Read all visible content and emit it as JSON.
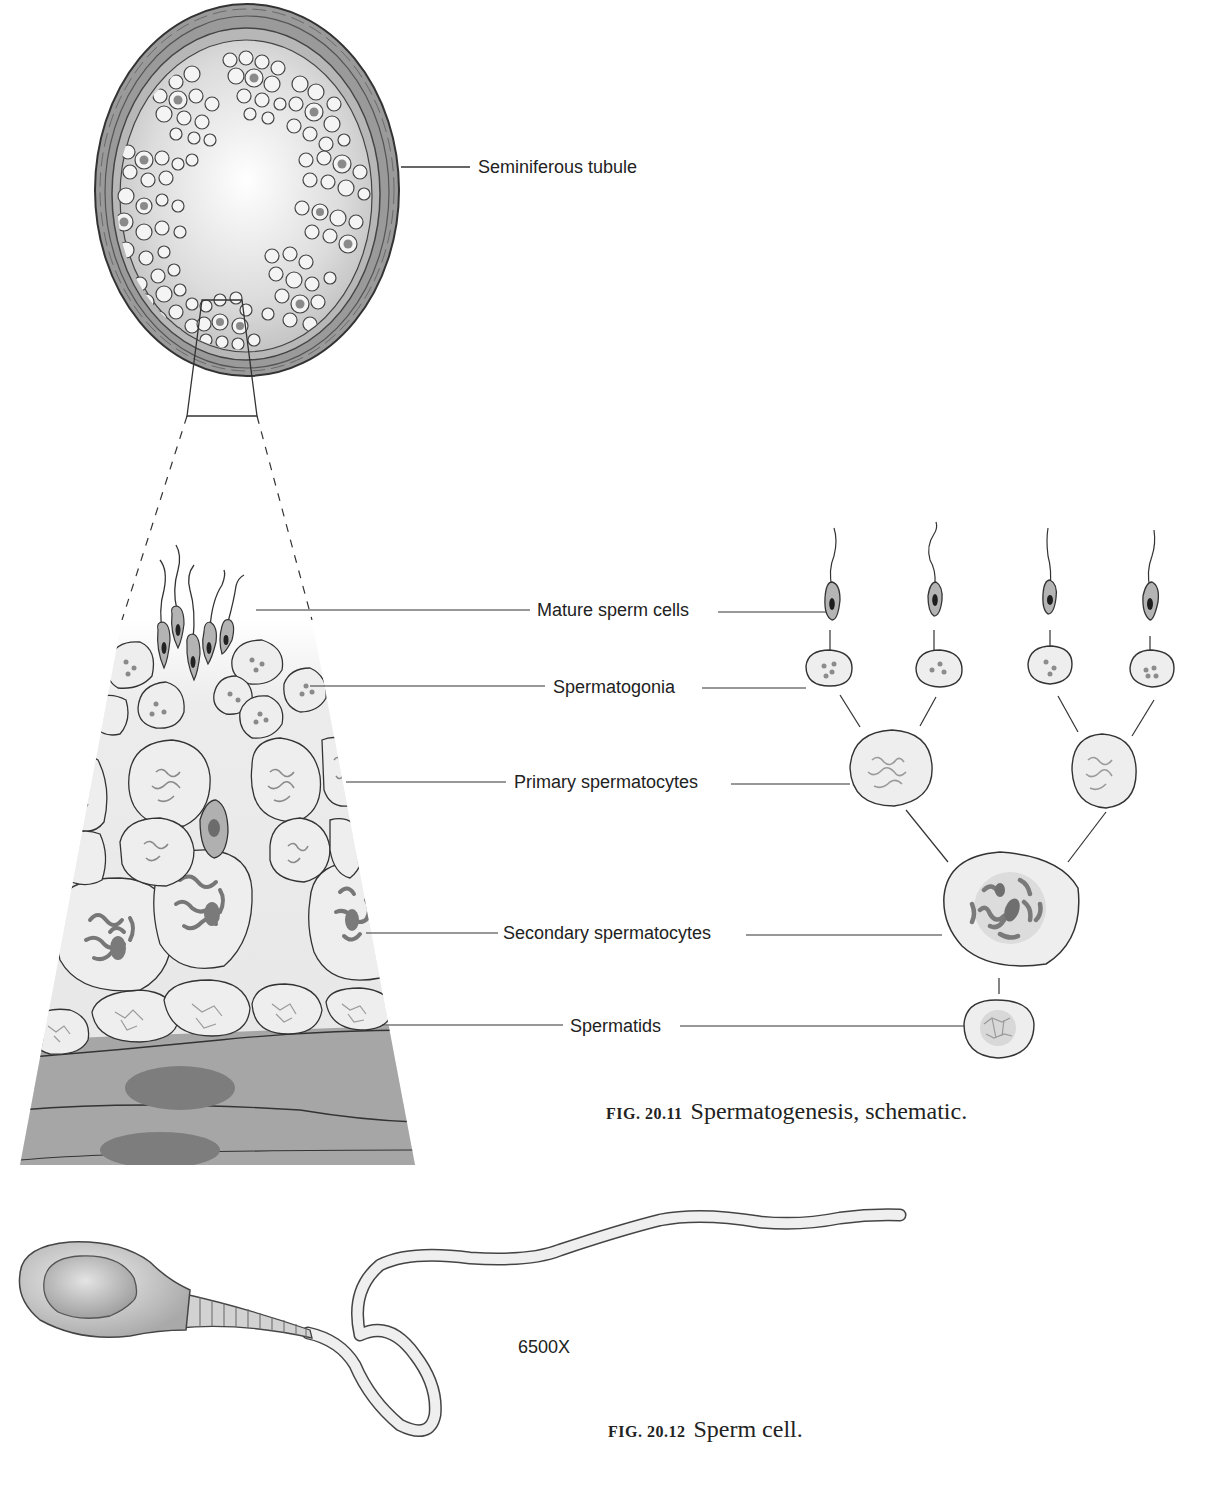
{
  "figure_20_11": {
    "caption_number": "FIG. 20.11",
    "caption_text": "Spermatogenesis, schematic.",
    "tubule_label": "Seminiferous tubule",
    "labels": [
      {
        "id": "mature-sperm-cells",
        "text": "Mature sperm cells"
      },
      {
        "id": "spermatogonia",
        "text": "Spermatogonia"
      },
      {
        "id": "primary-spermatocytes",
        "text": "Primary spermatocytes"
      },
      {
        "id": "secondary-spermatocytes",
        "text": "Secondary spermatocytes"
      },
      {
        "id": "spermatids",
        "text": "Spermatids"
      }
    ]
  },
  "figure_20_12": {
    "caption_number": "FIG. 20.12",
    "caption_text": "Sperm cell.",
    "magnification": "6500X"
  },
  "colors": {
    "outline": "#333333",
    "cell_fill": "#eeeeee",
    "tissue_fill": "#a8a8a8",
    "nucleus_dark": "#7a7a7a",
    "background": "#ffffff"
  }
}
